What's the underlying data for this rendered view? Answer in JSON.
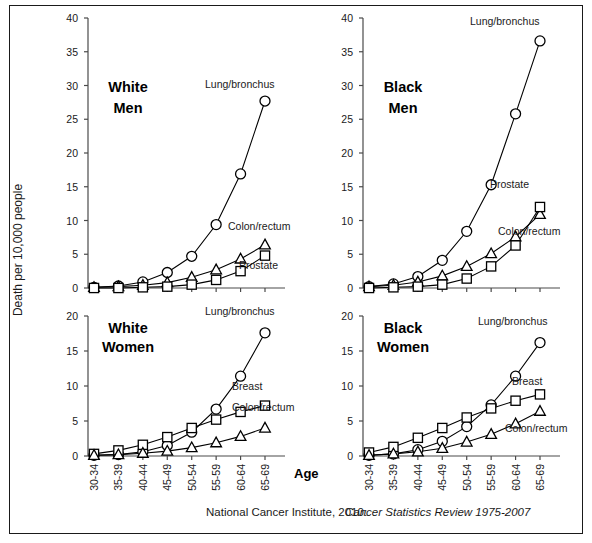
{
  "figure": {
    "top_cut_text": "",
    "caption_plain": "National Cancer Institute, 2010:",
    "caption_italic": "Cancer Statistics Review 1975-2007",
    "y_axis_title": "Death per 10,000 people",
    "x_axis_title": "Age",
    "colors": {
      "ink": "#000000",
      "axis": "#4a4a4a",
      "frame": "#1a1a1a",
      "background": "#ffffff"
    }
  },
  "chart_data": [
    {
      "type": "line",
      "title": "White\nMen",
      "title_line1": "White",
      "title_line2": "Men",
      "xlabel": "Age",
      "ylabel": "Death per 10,000 people",
      "categories": [
        "30-34",
        "35-39",
        "40-44",
        "45-49",
        "50-54",
        "55-59",
        "60-64",
        "65-69"
      ],
      "ylim": [
        0,
        40
      ],
      "yticks": [
        0,
        5,
        10,
        15,
        20,
        25,
        30,
        35,
        40
      ],
      "grid": false,
      "legend": "inline-annotations",
      "series": [
        {
          "name": "Lung/bronchus",
          "marker": "circle",
          "values": [
            0.1,
            0.3,
            0.9,
            2.3,
            4.7,
            9.4,
            16.9,
            27.7
          ]
        },
        {
          "name": "Colon/rectum",
          "marker": "triangle",
          "values": [
            0.1,
            0.2,
            0.4,
            0.8,
            1.6,
            2.7,
            4.3,
            6.4
          ]
        },
        {
          "name": "Prostate",
          "marker": "square",
          "values": [
            0.0,
            0.0,
            0.1,
            0.2,
            0.5,
            1.2,
            2.5,
            4.8
          ]
        }
      ]
    },
    {
      "type": "line",
      "title": "Black\nMen",
      "title_line1": "Black",
      "title_line2": "Men",
      "xlabel": "Age",
      "ylabel": "Death per 10,000 people",
      "categories": [
        "30-34",
        "35-39",
        "40-44",
        "45-49",
        "50-54",
        "55-59",
        "60-64",
        "65-69"
      ],
      "ylim": [
        0,
        40
      ],
      "yticks": [
        0,
        5,
        10,
        15,
        20,
        25,
        30,
        35,
        40
      ],
      "grid": false,
      "legend": "inline-annotations",
      "series": [
        {
          "name": "Lung/bronchus",
          "marker": "circle",
          "values": [
            0.2,
            0.6,
            1.7,
            4.1,
            8.4,
            15.3,
            25.8,
            36.6
          ]
        },
        {
          "name": "Colon/rectum",
          "marker": "triangle",
          "values": [
            0.2,
            0.4,
            0.9,
            1.8,
            3.2,
            5.1,
            7.6,
            10.9
          ]
        },
        {
          "name": "Prostate",
          "marker": "square",
          "values": [
            0.0,
            0.1,
            0.2,
            0.5,
            1.4,
            3.2,
            6.3,
            12.0
          ]
        }
      ]
    },
    {
      "type": "line",
      "title": "White\nWomen",
      "title_line1": "White",
      "title_line2": "Women",
      "xlabel": "Age",
      "ylabel": "Death per 10,000 people",
      "categories": [
        "30-34",
        "35-39",
        "40-44",
        "45-49",
        "50-54",
        "55-59",
        "60-64",
        "65-69"
      ],
      "ylim": [
        0,
        20
      ],
      "yticks": [
        0,
        5,
        10,
        15,
        20
      ],
      "grid": false,
      "legend": "inline-annotations",
      "series": [
        {
          "name": "Lung/bronchus",
          "marker": "circle",
          "values": [
            0.1,
            0.2,
            0.6,
            1.5,
            3.4,
            6.7,
            11.4,
            17.6
          ]
        },
        {
          "name": "Breast",
          "marker": "square",
          "values": [
            0.3,
            0.8,
            1.6,
            2.7,
            4.0,
            5.2,
            6.3,
            7.2
          ]
        },
        {
          "name": "Colon/rectum",
          "marker": "triangle",
          "values": [
            0.1,
            0.2,
            0.4,
            0.7,
            1.2,
            1.9,
            2.8,
            4.0
          ]
        }
      ]
    },
    {
      "type": "line",
      "title": "Black\nWomen",
      "title_line1": "Black",
      "title_line2": "Women",
      "xlabel": "Age",
      "ylabel": "Death per 10,000 people",
      "categories": [
        "30-34",
        "35-39",
        "40-44",
        "45-49",
        "50-54",
        "55-59",
        "60-64",
        "65-69"
      ],
      "ylim": [
        0,
        20
      ],
      "yticks": [
        0,
        5,
        10,
        15,
        20
      ],
      "grid": false,
      "legend": "inline-annotations",
      "series": [
        {
          "name": "Lung/bronchus",
          "marker": "circle",
          "values": [
            0.1,
            0.3,
            0.9,
            2.1,
            4.2,
            7.3,
            11.4,
            16.2
          ]
        },
        {
          "name": "Breast",
          "marker": "square",
          "values": [
            0.5,
            1.3,
            2.6,
            4.0,
            5.5,
            6.8,
            7.9,
            8.8
          ]
        },
        {
          "name": "Colon/rectum",
          "marker": "triangle",
          "values": [
            0.1,
            0.3,
            0.6,
            1.1,
            2.0,
            3.1,
            4.6,
            6.4
          ]
        }
      ]
    }
  ],
  "annotations": [
    {
      "panel": 0,
      "text": "Lung/bronchus",
      "x": 205,
      "y": 88,
      "anchor": "start"
    },
    {
      "panel": 0,
      "text": "Colon/rectum",
      "x": 228,
      "y": 230,
      "anchor": "start"
    },
    {
      "panel": 0,
      "text": "Prostate",
      "x": 239,
      "y": 269,
      "anchor": "start"
    },
    {
      "panel": 1,
      "text": "Lung/bronchus",
      "x": 470,
      "y": 25,
      "anchor": "start"
    },
    {
      "panel": 1,
      "text": "Prostate",
      "x": 490,
      "y": 188,
      "anchor": "start"
    },
    {
      "panel": 1,
      "text": "Colon/rectum",
      "x": 498,
      "y": 235,
      "anchor": "start"
    },
    {
      "panel": 2,
      "text": "Lung/bronchus",
      "x": 205,
      "y": 315,
      "anchor": "start"
    },
    {
      "panel": 2,
      "text": "Breast",
      "x": 232,
      "y": 390,
      "anchor": "start"
    },
    {
      "panel": 2,
      "text": "Colon/rectum",
      "x": 232,
      "y": 411,
      "anchor": "start"
    },
    {
      "panel": 3,
      "text": "Lung/bronchus",
      "x": 478,
      "y": 325,
      "anchor": "start"
    },
    {
      "panel": 3,
      "text": "Breast",
      "x": 512,
      "y": 385,
      "anchor": "start"
    },
    {
      "panel": 3,
      "text": "Colon/rectum",
      "x": 505,
      "y": 432,
      "anchor": "start"
    }
  ]
}
